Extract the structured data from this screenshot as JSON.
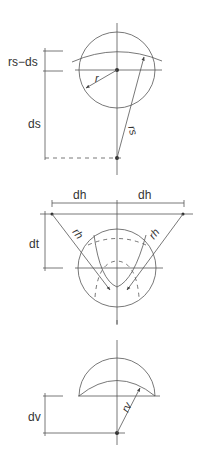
{
  "diagram": {
    "top": {
      "labels": {
        "rs_minus_ds": "rs−ds",
        "ds": "ds",
        "r": "r",
        "rs": "rs"
      }
    },
    "middle": {
      "labels": {
        "dh_left": "dh",
        "dh_right": "dh",
        "dt": "dt",
        "rh_left": "rh",
        "rh_right": "rh"
      }
    },
    "bottom": {
      "labels": {
        "dv": "dv",
        "rv": "rv"
      }
    },
    "colors": {
      "line": "#555555",
      "text": "#333333",
      "background": "#ffffff"
    }
  }
}
